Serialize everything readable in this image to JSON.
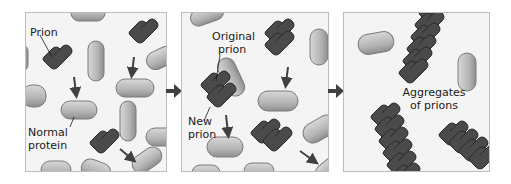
{
  "panels": [
    {
      "id": "stage-1",
      "labels": {
        "prion": "Prion",
        "normal_line1": "Normal",
        "normal_line2": "protein"
      }
    },
    {
      "id": "stage-2",
      "labels": {
        "original_line1": "Original",
        "original_line2": "prion",
        "new_line1": "New",
        "new_line2": "prion"
      }
    },
    {
      "id": "stage-3",
      "labels": {
        "aggregates_line1": "Aggregates",
        "aggregates_line2": "of prions"
      }
    }
  ],
  "colors": {
    "panel_bg": "#f4f4f4",
    "panel_border": "#bdbdbd",
    "prion": "#4a4a4a",
    "prion_edge": "#2a2a2a",
    "normal_protein": "#b8b8b8",
    "normal_protein_edge": "#7a7a7a",
    "arrow": "#404040"
  }
}
